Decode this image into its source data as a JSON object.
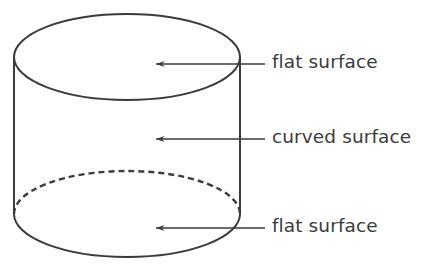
{
  "figure": {
    "background_color": "#ffffff",
    "stroke_color": "#3b3b3b",
    "text_color": "#3b3b3b",
    "shape": "cylinder"
  },
  "labels": {
    "top": "flat surface",
    "middle": "curved surface",
    "bottom": "flat surface"
  },
  "annotations": [
    {
      "id": "top-annotation",
      "text": "flat surface",
      "points_to": "top flat surface (upper circular face)",
      "arrow_from_x": 265,
      "arrow_to_x": 155,
      "arrow_y": 64
    },
    {
      "id": "middle-annotation",
      "text": "curved surface",
      "points_to": "curved lateral surface",
      "arrow_from_x": 265,
      "arrow_to_x": 155,
      "arrow_y": 139
    },
    {
      "id": "bottom-annotation",
      "text": "flat surface",
      "points_to": "bottom flat surface (lower circular face)",
      "arrow_from_x": 265,
      "arrow_to_x": 155,
      "arrow_y": 228
    }
  ],
  "geometry": {
    "center_x": 127,
    "radius_x": 113,
    "radius_y": 43,
    "top_ellipse_center_y": 57,
    "bottom_ellipse_center_y": 214,
    "bottom_back_arc_style": "dashed",
    "bottom_front_arc_style": "solid"
  }
}
